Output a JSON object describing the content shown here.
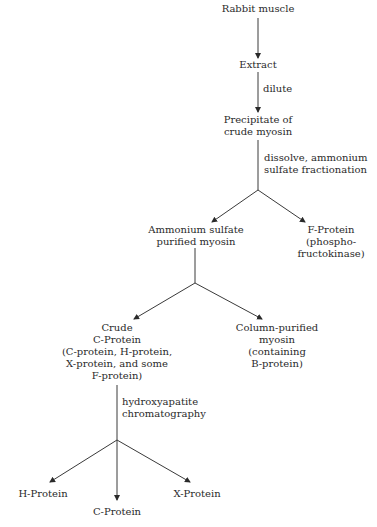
{
  "nodes": {
    "rabbit_muscle": {
      "lines": [
        "Rabbit muscle"
      ]
    },
    "extract": {
      "lines": [
        "Extract"
      ]
    },
    "precipitate": {
      "lines": [
        "Precipitate of",
        "crude myosin"
      ]
    },
    "ammonium_purified": {
      "lines": [
        "Ammonium sulfate",
        "purified myosin"
      ]
    },
    "f_protein": {
      "lines": [
        "F-Protein",
        "(phospho-",
        "fructokinase)"
      ]
    },
    "crude_c_protein": {
      "lines": [
        "Crude",
        "C-Protein",
        "(C-protein, H-protein,",
        "X-protein, and some",
        "F-protein)"
      ]
    },
    "column_purified": {
      "lines": [
        "Column-purified",
        "myosin",
        "(containing",
        "B-protein)"
      ]
    },
    "h_protein": {
      "lines": [
        "H-Protein"
      ]
    },
    "c_protein": {
      "lines": [
        "C-Protein"
      ]
    },
    "x_protein": {
      "lines": [
        "X-Protein"
      ]
    }
  },
  "steps": {
    "dilute": {
      "lines": [
        "dilute"
      ]
    },
    "dissolve": {
      "lines": [
        "dissolve, ammonium",
        "sulfate fractionation"
      ]
    },
    "hydroxyapatite": {
      "lines": [
        "hydroxyapatite",
        "chromatography"
      ]
    }
  },
  "colors": {
    "line": "#3a3a3a",
    "text": "#2a2a2a"
  }
}
